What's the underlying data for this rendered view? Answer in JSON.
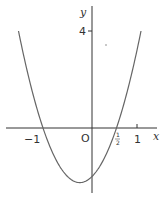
{
  "chart_data": {
    "type": "line",
    "title": "",
    "xlabel": "x",
    "ylabel": "y",
    "function": "y = 4(x+1)(x-1/2)",
    "x_ticks": [
      {
        "value": -1,
        "label": "−1"
      },
      {
        "value": 0,
        "label": "O"
      },
      {
        "value": 0.5,
        "label": "½"
      },
      {
        "value": 1,
        "label": "1"
      }
    ],
    "y_ticks": [
      {
        "value": 4,
        "label": "4"
      }
    ],
    "xlim": [
      -1.55,
      1.2
    ],
    "ylim": [
      -2.7,
      5.2
    ],
    "grid": false,
    "legend": null,
    "series": [
      {
        "name": "parabola",
        "x": [
          -1.5,
          -1.25,
          -1.0,
          -0.75,
          -0.5,
          -0.25,
          0.0,
          0.25,
          0.5,
          0.75,
          1.0
        ],
        "values": [
          4.0,
          1.75,
          0.0,
          -1.25,
          -2.0,
          -2.25,
          -2.0,
          -1.25,
          0.0,
          1.75,
          4.0
        ]
      }
    ],
    "annotations": {
      "roots": [
        -1,
        0.5
      ],
      "y_intercept": -2,
      "minimum": {
        "x": -0.25,
        "y": -2.25
      }
    }
  },
  "labels": {
    "y_axis": "y",
    "x_axis": "x",
    "y_tick_4": "4",
    "x_tick_neg1": "−1",
    "origin": "O",
    "half_num": "1",
    "half_den": "2",
    "x_tick_1": "1"
  }
}
